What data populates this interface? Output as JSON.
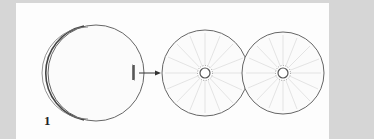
{
  "figure": {
    "panel_label": "1",
    "elements": [
      {
        "name": "single-cell",
        "description": "single spherical cell with furrow region on right edge"
      },
      {
        "name": "arrow",
        "description": "transition arrow"
      },
      {
        "name": "daughter-cell-left",
        "description": "cell with radial astral lines and central nucleus"
      },
      {
        "name": "daughter-cell-right",
        "description": "cell with radial astral lines and central nucleus"
      }
    ]
  },
  "colors": {
    "background": "#d6d6d6",
    "panel": "#fdfdfd",
    "stroke": "#555555",
    "rays": "#d0d0d0"
  }
}
